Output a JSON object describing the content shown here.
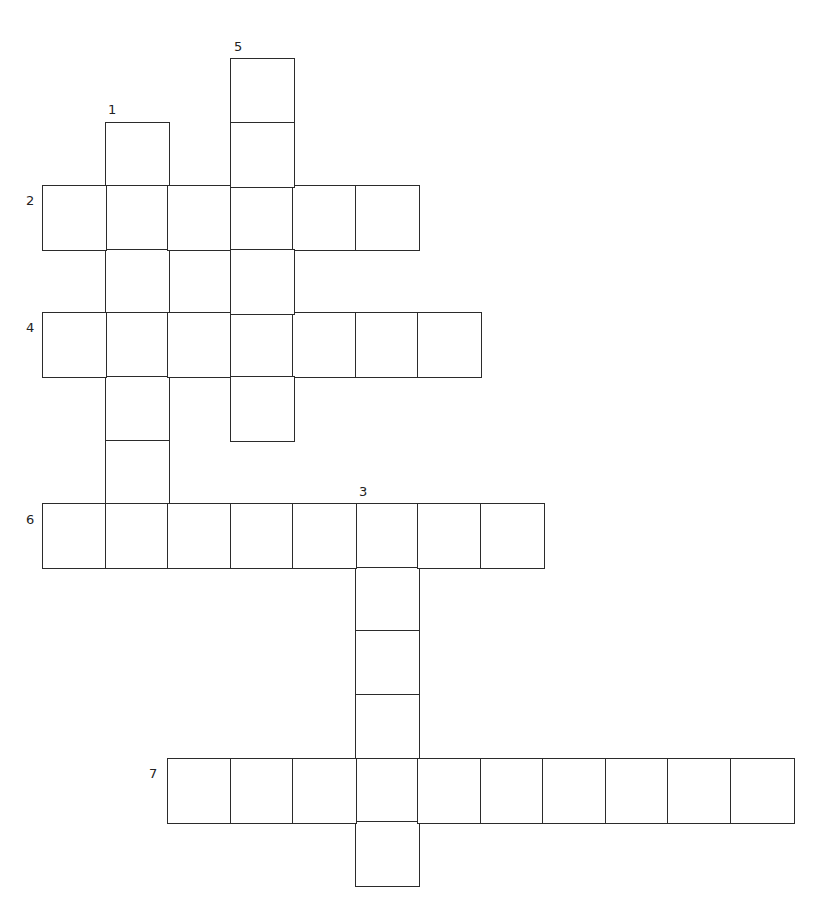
{
  "puzzle": {
    "type": "crossword",
    "grid": {
      "origin_x": 42,
      "origin_y": 58,
      "cell_w": 62.5,
      "cell_h": 63.6
    },
    "words": [
      {
        "number": "1",
        "direction": "down",
        "row": 1,
        "col": 1,
        "length": 6
      },
      {
        "number": "2",
        "direction": "across",
        "row": 2,
        "col": 0,
        "length": 6
      },
      {
        "number": "3",
        "direction": "down",
        "row": 7,
        "col": 5,
        "length": 6
      },
      {
        "number": "4",
        "direction": "across",
        "row": 4,
        "col": 0,
        "length": 7
      },
      {
        "number": "5",
        "direction": "down",
        "row": 0,
        "col": 3,
        "length": 6
      },
      {
        "number": "6",
        "direction": "across",
        "row": 7,
        "col": 0,
        "length": 8
      },
      {
        "number": "7",
        "direction": "across",
        "row": 11,
        "col": 2,
        "length": 10
      }
    ],
    "labels": [
      {
        "number": "1",
        "x": 108,
        "y": 103
      },
      {
        "number": "2",
        "x": 26,
        "y": 194
      },
      {
        "number": "3",
        "x": 359,
        "y": 485
      },
      {
        "number": "4",
        "x": 26,
        "y": 321
      },
      {
        "number": "5",
        "x": 234,
        "y": 40
      },
      {
        "number": "6",
        "x": 26,
        "y": 513
      },
      {
        "number": "7",
        "x": 149,
        "y": 767
      }
    ]
  }
}
